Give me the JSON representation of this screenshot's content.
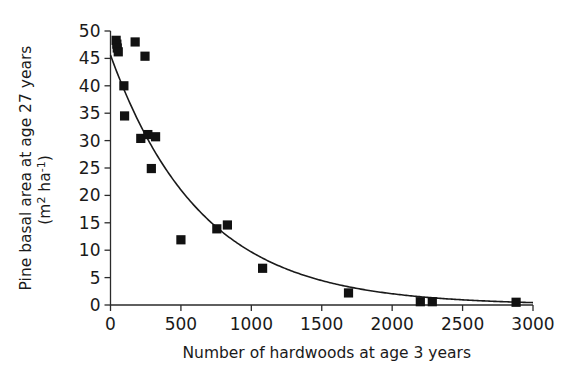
{
  "chart_data": {
    "type": "scatter",
    "title": "",
    "xlabel": "Number of hardwoods at age 3 years",
    "ylabel_line1": "Pine basal area at age 27 years",
    "ylabel_line2": "(m2 ha-1)",
    "ylabel_units_prefix": "(m",
    "ylabel_units_sup1": "2",
    "ylabel_units_mid": " ha",
    "ylabel_units_sup2": "-1",
    "ylabel_units_suffix": ")",
    "xlim": [
      0,
      3000
    ],
    "ylim": [
      0,
      50
    ],
    "xticks": [
      0,
      500,
      1000,
      1500,
      2000,
      2500,
      3000
    ],
    "xtick_labels": [
      "0",
      "500",
      "1000",
      "1500",
      "2000",
      "2500",
      "3000"
    ],
    "yticks": [
      0,
      5,
      10,
      15,
      20,
      25,
      30,
      35,
      40,
      45,
      50
    ],
    "ytick_labels": [
      "0",
      "5",
      "10",
      "15",
      "20",
      "25",
      "30",
      "35",
      "40",
      "45",
      "50"
    ],
    "grid": false,
    "legend": false,
    "marker": "filled-square",
    "marker_color": "#111111",
    "curve_color": "#1a1a1a",
    "axis_color": "#2b2b2b",
    "points": [
      {
        "x": 40,
        "y": 48.3
      },
      {
        "x": 45,
        "y": 47.6
      },
      {
        "x": 48,
        "y": 46.9
      },
      {
        "x": 55,
        "y": 46.2
      },
      {
        "x": 175,
        "y": 48.0
      },
      {
        "x": 245,
        "y": 45.4
      },
      {
        "x": 95,
        "y": 40.0
      },
      {
        "x": 100,
        "y": 34.5
      },
      {
        "x": 215,
        "y": 30.4
      },
      {
        "x": 265,
        "y": 31.1
      },
      {
        "x": 320,
        "y": 30.7
      },
      {
        "x": 290,
        "y": 24.9
      },
      {
        "x": 500,
        "y": 11.9
      },
      {
        "x": 755,
        "y": 13.9
      },
      {
        "x": 830,
        "y": 14.6
      },
      {
        "x": 1080,
        "y": 6.7
      },
      {
        "x": 1690,
        "y": 2.2
      },
      {
        "x": 2200,
        "y": 0.6
      },
      {
        "x": 2285,
        "y": 0.6
      },
      {
        "x": 2880,
        "y": 0.5
      }
    ],
    "fit_curve": {
      "description": "exponential decay fit",
      "y0": 45.6,
      "decay_k": 0.00155,
      "x_start": 0,
      "x_end": 3000
    }
  }
}
